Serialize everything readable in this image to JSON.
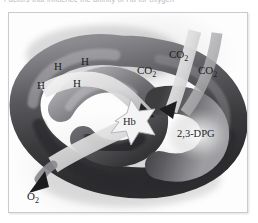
{
  "caption": {
    "top_cutoff_text": "Factors that influence the affinity of Hb for oxygen"
  },
  "figure": {
    "name": "hemoglobin-oxygen-affinity-diagram",
    "style": "grayscale halftone rendering of a twisted torus (trefoil-like loop) representing the hemoglobin / red cell, with ribbon arrows entering and leaving",
    "colors": {
      "background": "#fdfdfd",
      "frame_border": "#c9cbd0",
      "torus_dark": "#3b3b3e",
      "torus_mid": "#6e6e72",
      "torus_light": "#c8c8cb",
      "ribbon_light": "#e9e9ea",
      "label_text": "#1d1d1f"
    },
    "center_label": "Hb",
    "labels": [
      {
        "id": "h-1",
        "text": "H",
        "role": "hydrogen-ion",
        "x": 45,
        "y": 54
      },
      {
        "id": "h-2",
        "text": "H",
        "role": "hydrogen-ion",
        "x": 72,
        "y": 49
      },
      {
        "id": "h-3",
        "text": "H",
        "role": "hydrogen-ion",
        "x": 64,
        "y": 71
      },
      {
        "id": "h-4",
        "text": "H",
        "role": "hydrogen-ion",
        "x": 28,
        "y": 73
      }
    ],
    "co2_labels": [
      {
        "id": "co2-1",
        "text": "CO",
        "sub": "2",
        "x": 145,
        "y": 58
      },
      {
        "id": "co2-2",
        "text": "CO",
        "sub": "2",
        "x": 173,
        "y": 42
      },
      {
        "id": "co2-3",
        "text": "CO",
        "sub": "2",
        "x": 196,
        "y": 58
      }
    ],
    "o2_label": {
      "text": "O",
      "sub": "2",
      "x": 26,
      "y": 192
    },
    "dpg_label": {
      "text": "2,3-DPG",
      "x": 183,
      "y": 140
    }
  }
}
